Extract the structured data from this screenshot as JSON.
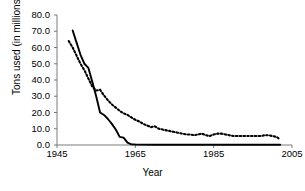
{
  "chart_data": {
    "type": "line",
    "title": "",
    "xlabel": "Year",
    "ylabel": "Tons used (in millions)",
    "xlim": [
      1945,
      2005
    ],
    "ylim": [
      0.0,
      80.0
    ],
    "grid": false,
    "legend": "none",
    "xticks": [
      "1945",
      "1965",
      "1985",
      "2005"
    ],
    "xtick_values": [
      1945,
      1965,
      1985,
      2005
    ],
    "yticks": [
      "0.0",
      "10.0",
      "20.0",
      "30.0",
      "40.0",
      "50.0",
      "60.0",
      "70.0",
      "80.0"
    ],
    "ytick_values": [
      0,
      10,
      20,
      30,
      40,
      50,
      60,
      70,
      80
    ],
    "series": [
      {
        "name": "solid-series",
        "style": "solid",
        "color": "#000000",
        "x": [
          1949,
          1950,
          1951,
          1952,
          1953,
          1954,
          1955,
          1956,
          1957,
          1958,
          1959,
          1960,
          1961,
          1962,
          1963,
          1964,
          1965,
          1970,
          1975,
          1980,
          1985,
          1990,
          1995,
          2000,
          2002
        ],
        "values": [
          70.5,
          63.0,
          55.5,
          50.0,
          47.5,
          39.0,
          30.0,
          20.0,
          18.5,
          16.0,
          13.0,
          9.5,
          5.0,
          4.5,
          1.5,
          0.4,
          0.3,
          0.2,
          0.2,
          0.2,
          0.2,
          0.2,
          0.2,
          0.2,
          0.2
        ]
      },
      {
        "name": "dotted-series",
        "style": "dotted",
        "color": "#000000",
        "x": [
          1948,
          1949,
          1950,
          1951,
          1952,
          1953,
          1954,
          1955,
          1956,
          1957,
          1958,
          1959,
          1960,
          1961,
          1962,
          1963,
          1964,
          1965,
          1966,
          1967,
          1968,
          1969,
          1970,
          1971,
          1972,
          1973,
          1974,
          1975,
          1976,
          1977,
          1978,
          1979,
          1980,
          1981,
          1982,
          1983,
          1984,
          1985,
          1986,
          1987,
          1988,
          1989,
          1990,
          1991,
          1992,
          1993,
          1994,
          1995,
          1996,
          1997,
          1998,
          1999,
          2000,
          2001,
          2002
        ],
        "values": [
          64.0,
          60.0,
          55.0,
          50.0,
          46.0,
          41.0,
          36.0,
          33.5,
          34.0,
          30.5,
          27.5,
          25.0,
          23.0,
          21.0,
          19.5,
          18.5,
          17.0,
          15.5,
          14.5,
          13.0,
          12.0,
          11.0,
          11.5,
          10.0,
          9.5,
          9.0,
          8.5,
          8.0,
          7.5,
          7.0,
          6.5,
          6.5,
          6.0,
          6.5,
          7.0,
          6.0,
          5.5,
          6.5,
          7.0,
          7.0,
          6.5,
          6.0,
          5.5,
          5.5,
          5.5,
          5.5,
          5.5,
          5.5,
          5.5,
          5.5,
          6.0,
          6.0,
          5.5,
          5.0,
          3.5
        ]
      }
    ]
  },
  "axis": {
    "line_color": "#7a7a7a"
  }
}
